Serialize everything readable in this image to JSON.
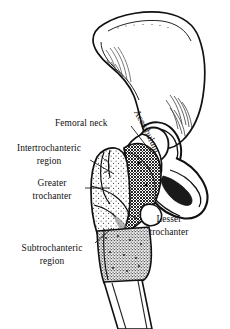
{
  "figure": {
    "background_color": "#ffffff",
    "ink_color": "#111111",
    "width": 230,
    "height": 329
  },
  "labels": {
    "femoral_neck": "Femoral neck",
    "intertrochanteric_line1": "Intertrochanteric",
    "intertrochanteric_line2": "region",
    "greater_line1": "Greater",
    "greater_line2": "trochanter",
    "subtrochanteric_line1": "Subtrochanteric",
    "subtrochanteric_line2": "region",
    "lesser_line1": "Lesser",
    "lesser_line2": "trochanter",
    "acetabulum": "Acetabulum"
  },
  "regions": [
    {
      "id": "pelvis-ilium",
      "name": "Ilium / pelvis",
      "texture": "outline",
      "fill": "#ffffff"
    },
    {
      "id": "femoral-head",
      "name": "Femoral head",
      "texture": "outline",
      "fill": "#ffffff"
    },
    {
      "id": "femoral-neck",
      "name": "Femoral neck",
      "texture": "outline",
      "fill": "#ffffff"
    },
    {
      "id": "greater-trochanter",
      "name": "Greater trochanter",
      "texture": "stipple-light",
      "fill": "#fdfdfd"
    },
    {
      "id": "intertrochanteric-region",
      "name": "Intertrochanteric region",
      "texture": "crosshatch-dense",
      "fill": "#9a9a9a"
    },
    {
      "id": "subtrochanteric-region",
      "name": "Subtrochanteric region",
      "texture": "stipple-dense",
      "fill": "#8f8f8f"
    },
    {
      "id": "femoral-shaft",
      "name": "Femoral shaft",
      "texture": "outline",
      "fill": "#ffffff"
    }
  ]
}
